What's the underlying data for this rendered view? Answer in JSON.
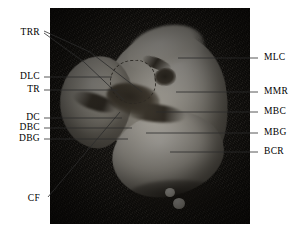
{
  "figure": {
    "kind": "labeled-anatomical-specimen-photograph",
    "background_color": "#ffffff",
    "photo": {
      "background_color": "#17140f",
      "specimen_color": "#dedbd2",
      "fissure_color": "#2a251d",
      "x": 50,
      "y": 8,
      "width": 200,
      "height": 216
    },
    "leader_line_color": "#2c2c2c",
    "label_color": "#000000"
  },
  "labels": {
    "left": [
      {
        "id": "TRR",
        "text": "TRR",
        "x": 40,
        "y": 33
      },
      {
        "id": "DLC",
        "text": "DLC",
        "x": 40,
        "y": 77
      },
      {
        "id": "TR",
        "text": "TR",
        "x": 40,
        "y": 90
      },
      {
        "id": "DC",
        "text": "DC",
        "x": 40,
        "y": 118
      },
      {
        "id": "DBC",
        "text": "DBC",
        "x": 40,
        "y": 128
      },
      {
        "id": "DBG",
        "text": "DBG",
        "x": 40,
        "y": 139
      },
      {
        "id": "CF",
        "text": "CF",
        "x": 40,
        "y": 199
      }
    ],
    "right": [
      {
        "id": "MLC",
        "text": "MLC",
        "x": 264,
        "y": 58
      },
      {
        "id": "MMR",
        "text": "MMR",
        "x": 264,
        "y": 92
      },
      {
        "id": "MBC",
        "text": "MBC",
        "x": 264,
        "y": 112
      },
      {
        "id": "MBG",
        "text": "MBG",
        "x": 264,
        "y": 133
      },
      {
        "id": "BCR",
        "text": "BCR",
        "x": 264,
        "y": 152
      }
    ]
  },
  "leaders": [
    {
      "for": "TRR",
      "points": "44,31 90,52 142,92"
    },
    {
      "for": "TRR-2",
      "points": "44,33 84,62 124,100"
    },
    {
      "for": "DLC",
      "points": "44,77 112,77"
    },
    {
      "for": "TR",
      "points": "44,90 118,90"
    },
    {
      "for": "DC",
      "points": "44,118 122,118"
    },
    {
      "for": "DBC",
      "points": "44,128 132,128"
    },
    {
      "for": "DBG",
      "points": "44,139 128,139"
    },
    {
      "for": "CF",
      "points": "48,197 120,112"
    },
    {
      "for": "MLC",
      "points": "258,58 178,58"
    },
    {
      "for": "MMR",
      "points": "258,92 176,92"
    },
    {
      "for": "MBC",
      "points": "258,112 156,112"
    },
    {
      "for": "MBG",
      "points": "258,133 146,133"
    },
    {
      "for": "BCR",
      "points": "258,152 170,152"
    }
  ]
}
